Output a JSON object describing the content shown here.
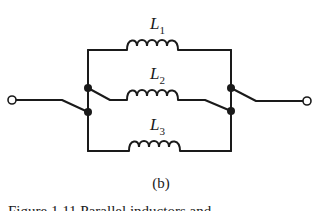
{
  "diagram": {
    "type": "circuit-schematic",
    "inductors": [
      {
        "id": "L1",
        "symbol": "L",
        "subscript": "1"
      },
      {
        "id": "L2",
        "symbol": "L",
        "subscript": "2"
      },
      {
        "id": "L3",
        "symbol": "L",
        "subscript": "3"
      }
    ],
    "terminals": [
      "left-terminal",
      "right-terminal"
    ],
    "subfigure_label": "(b)",
    "caption_partial": "Figure 1.11  Parallel inductors and"
  }
}
